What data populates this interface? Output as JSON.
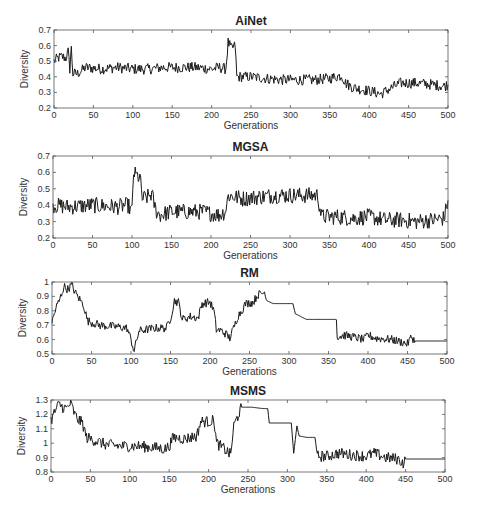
{
  "figure": {
    "width": 477,
    "height": 512,
    "line_color": "#1a1a1a",
    "axis_color": "#555555"
  },
  "chart_data": [
    {
      "type": "line",
      "title": "AiNet",
      "xlabel": "Generations",
      "ylabel": "Diversity",
      "xlim": [
        0,
        500
      ],
      "ylim": [
        0.2,
        0.7
      ],
      "xticks": [
        0,
        50,
        100,
        150,
        200,
        250,
        300,
        350,
        400,
        450,
        500
      ],
      "yticks": [
        0.2,
        0.3,
        0.4,
        0.5,
        0.6,
        0.7
      ],
      "grid": false,
      "box": {
        "left": 54,
        "top": 30,
        "right": 448,
        "bottom": 108
      },
      "noise": 0.035,
      "series": [
        {
          "name": "AiNet",
          "points": [
            [
              0,
              0.5
            ],
            [
              5,
              0.52
            ],
            [
              10,
              0.53
            ],
            [
              15,
              0.52
            ],
            [
              18,
              0.56
            ],
            [
              20,
              0.45
            ],
            [
              22,
              0.58
            ],
            [
              24,
              0.42
            ],
            [
              30,
              0.42
            ],
            [
              40,
              0.46
            ],
            [
              60,
              0.45
            ],
            [
              80,
              0.46
            ],
            [
              100,
              0.45
            ],
            [
              120,
              0.45
            ],
            [
              140,
              0.46
            ],
            [
              160,
              0.46
            ],
            [
              180,
              0.46
            ],
            [
              200,
              0.45
            ],
            [
              210,
              0.46
            ],
            [
              218,
              0.45
            ],
            [
              221,
              0.62
            ],
            [
              225,
              0.58
            ],
            [
              230,
              0.6
            ],
            [
              232,
              0.4
            ],
            [
              250,
              0.4
            ],
            [
              270,
              0.39
            ],
            [
              290,
              0.38
            ],
            [
              310,
              0.38
            ],
            [
              330,
              0.38
            ],
            [
              350,
              0.39
            ],
            [
              365,
              0.41
            ],
            [
              370,
              0.36
            ],
            [
              380,
              0.33
            ],
            [
              400,
              0.31
            ],
            [
              415,
              0.29
            ],
            [
              425,
              0.32
            ],
            [
              440,
              0.36
            ],
            [
              460,
              0.36
            ],
            [
              480,
              0.35
            ],
            [
              495,
              0.34
            ],
            [
              500,
              0.35
            ]
          ]
        }
      ]
    },
    {
      "type": "line",
      "title": "MGSA",
      "xlabel": "Generations",
      "ylabel": "Diversity",
      "xlim": [
        0,
        500
      ],
      "ylim": [
        0.2,
        0.7
      ],
      "xticks": [
        0,
        50,
        100,
        150,
        200,
        250,
        300,
        350,
        400,
        450,
        500
      ],
      "yticks": [
        0.2,
        0.3,
        0.4,
        0.5,
        0.6,
        0.7
      ],
      "grid": false,
      "box": {
        "left": 53,
        "top": 156,
        "right": 448,
        "bottom": 238
      },
      "noise": 0.05,
      "series": [
        {
          "name": "MGSA",
          "points": [
            [
              0,
              0.4
            ],
            [
              20,
              0.39
            ],
            [
              50,
              0.4
            ],
            [
              80,
              0.39
            ],
            [
              95,
              0.4
            ],
            [
              100,
              0.36
            ],
            [
              102,
              0.6
            ],
            [
              105,
              0.58
            ],
            [
              110,
              0.57
            ],
            [
              113,
              0.44
            ],
            [
              120,
              0.45
            ],
            [
              125,
              0.47
            ],
            [
              130,
              0.37
            ],
            [
              135,
              0.34
            ],
            [
              150,
              0.36
            ],
            [
              170,
              0.36
            ],
            [
              190,
              0.36
            ],
            [
              210,
              0.34
            ],
            [
              218,
              0.36
            ],
            [
              222,
              0.46
            ],
            [
              240,
              0.44
            ],
            [
              260,
              0.45
            ],
            [
              280,
              0.46
            ],
            [
              300,
              0.46
            ],
            [
              320,
              0.46
            ],
            [
              335,
              0.46
            ],
            [
              340,
              0.33
            ],
            [
              360,
              0.33
            ],
            [
              380,
              0.32
            ],
            [
              400,
              0.33
            ],
            [
              420,
              0.31
            ],
            [
              440,
              0.31
            ],
            [
              460,
              0.3
            ],
            [
              480,
              0.31
            ],
            [
              495,
              0.32
            ],
            [
              500,
              0.43
            ]
          ]
        }
      ]
    },
    {
      "type": "line",
      "title": "RM",
      "xlabel": "Generations",
      "ylabel": "Diversity",
      "xlim": [
        0,
        500
      ],
      "ylim": [
        0.5,
        1.0
      ],
      "xticks": [
        0,
        50,
        100,
        150,
        200,
        250,
        300,
        350,
        400,
        450,
        500
      ],
      "yticks": [
        0.5,
        0.6,
        0.7,
        0.8,
        0.9,
        1
      ],
      "grid": false,
      "box": {
        "left": 52,
        "top": 282,
        "right": 447,
        "bottom": 354
      },
      "noise": 0.03,
      "series": [
        {
          "name": "RM",
          "points": [
            [
              0,
              0.72
            ],
            [
              5,
              0.82
            ],
            [
              10,
              0.88
            ],
            [
              15,
              0.97
            ],
            [
              20,
              0.95
            ],
            [
              25,
              0.98
            ],
            [
              30,
              0.92
            ],
            [
              35,
              0.88
            ],
            [
              40,
              0.84
            ],
            [
              45,
              0.73
            ],
            [
              60,
              0.7
            ],
            [
              80,
              0.69
            ],
            [
              95,
              0.68
            ],
            [
              100,
              0.6
            ],
            [
              104,
              0.52
            ],
            [
              110,
              0.66
            ],
            [
              130,
              0.68
            ],
            [
              145,
              0.68
            ],
            [
              150,
              0.75
            ],
            [
              155,
              0.87
            ],
            [
              160,
              0.86
            ],
            [
              165,
              0.74
            ],
            [
              175,
              0.76
            ],
            [
              185,
              0.75
            ],
            [
              190,
              0.85
            ],
            [
              200,
              0.86
            ],
            [
              205,
              0.8
            ],
            [
              208,
              0.67
            ],
            [
              215,
              0.66
            ],
            [
              220,
              0.64
            ],
            [
              225,
              0.61
            ],
            [
              230,
              0.68
            ],
            [
              235,
              0.76
            ],
            [
              240,
              0.8
            ],
            [
              245,
              0.85
            ],
            [
              255,
              0.86
            ],
            [
              260,
              0.91
            ],
            [
              265,
              0.92
            ],
            [
              270,
              0.93
            ],
            [
              272,
              0.87
            ],
            [
              280,
              0.85
            ],
            [
              305,
              0.85
            ],
            [
              308,
              0.78
            ],
            [
              315,
              0.76
            ],
            [
              322,
              0.74
            ],
            [
              330,
              0.74
            ],
            [
              360,
              0.74
            ],
            [
              361,
              0.62
            ],
            [
              370,
              0.63
            ],
            [
              380,
              0.62
            ],
            [
              395,
              0.6
            ],
            [
              400,
              0.63
            ],
            [
              410,
              0.61
            ],
            [
              430,
              0.6
            ],
            [
              445,
              0.58
            ],
            [
              450,
              0.57
            ],
            [
              455,
              0.62
            ],
            [
              460,
              0.59
            ],
            [
              500,
              0.59
            ]
          ]
        }
      ]
    },
    {
      "type": "line",
      "title": "MSMS",
      "xlabel": "Generations",
      "ylabel": "Diversity",
      "xlim": [
        0,
        500
      ],
      "ylim": [
        0.8,
        1.3
      ],
      "xticks": [
        0,
        50,
        100,
        150,
        200,
        250,
        300,
        350,
        400,
        450,
        500
      ],
      "yticks": [
        0.8,
        0.9,
        1,
        1.1,
        1.2,
        1.3
      ],
      "grid": false,
      "box": {
        "left": 51,
        "top": 400,
        "right": 445,
        "bottom": 472
      },
      "noise": 0.04,
      "series": [
        {
          "name": "MSMS",
          "points": [
            [
              0,
              1.16
            ],
            [
              5,
              1.22
            ],
            [
              10,
              1.27
            ],
            [
              15,
              1.25
            ],
            [
              20,
              1.24
            ],
            [
              25,
              1.28
            ],
            [
              30,
              1.2
            ],
            [
              35,
              1.16
            ],
            [
              40,
              1.14
            ],
            [
              45,
              1.04
            ],
            [
              55,
              1.02
            ],
            [
              70,
              0.99
            ],
            [
              90,
              0.98
            ],
            [
              110,
              0.98
            ],
            [
              130,
              0.97
            ],
            [
              145,
              0.96
            ],
            [
              150,
              0.98
            ],
            [
              155,
              1.04
            ],
            [
              170,
              1.03
            ],
            [
              185,
              1.05
            ],
            [
              190,
              1.15
            ],
            [
              200,
              1.15
            ],
            [
              207,
              1.16
            ],
            [
              210,
              1.0
            ],
            [
              220,
              0.96
            ],
            [
              228,
              0.92
            ],
            [
              232,
              1.12
            ],
            [
              238,
              1.2
            ],
            [
              242,
              1.25
            ],
            [
              255,
              1.25
            ],
            [
              270,
              1.24
            ],
            [
              275,
              1.24
            ],
            [
              277,
              1.14
            ],
            [
              305,
              1.14
            ],
            [
              308,
              0.93
            ],
            [
              312,
              1.12
            ],
            [
              315,
              1.05
            ],
            [
              325,
              1.04
            ],
            [
              335,
              1.04
            ],
            [
              338,
              0.91
            ],
            [
              350,
              0.91
            ],
            [
              365,
              0.93
            ],
            [
              380,
              0.92
            ],
            [
              400,
              0.91
            ],
            [
              410,
              0.93
            ],
            [
              425,
              0.9
            ],
            [
              440,
              0.89
            ],
            [
              448,
              0.86
            ],
            [
              450,
              0.89
            ],
            [
              500,
              0.89
            ]
          ]
        }
      ]
    }
  ]
}
